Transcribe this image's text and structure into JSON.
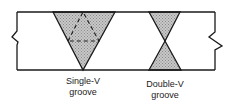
{
  "diagram": {
    "joints": [
      {
        "id": "single-v",
        "label_line1": "Single-V",
        "label_line2": "groove"
      },
      {
        "id": "double-v",
        "label_line1": "Double-V",
        "label_line2": "groove"
      }
    ],
    "colors": {
      "line": "#1a1a1a",
      "weld_fill": "#b8b8b8",
      "background": "#ffffff"
    }
  }
}
